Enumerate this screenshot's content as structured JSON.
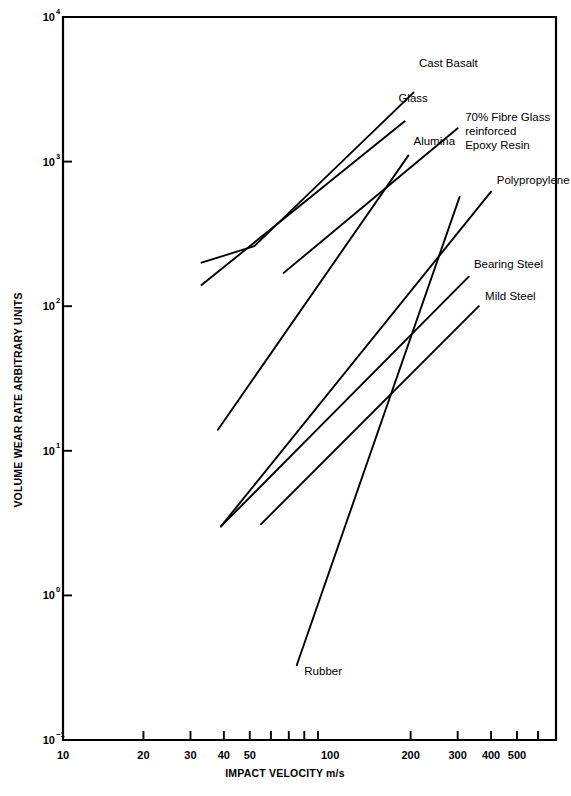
{
  "chart_data": {
    "type": "line",
    "title": "",
    "xlabel": "IMPACT VELOCITY m/s",
    "ylabel": "VOLUME WEAR RATE ARBITRARY UNITS",
    "xscale": "log",
    "yscale": "log",
    "xlim": [
      10,
      700
    ],
    "ylim": [
      0.1,
      10000
    ],
    "grid": false,
    "legend_position": "inline-right-of-line-ends",
    "xticks_major": [
      10,
      20,
      30,
      40,
      50,
      100,
      200,
      300,
      400,
      500
    ],
    "xtick_labels": [
      "10",
      "20",
      "30",
      "40",
      "50",
      "100",
      "200",
      "300",
      "400",
      "500"
    ],
    "yticks_major": [
      0.1,
      1,
      10,
      100,
      1000,
      10000
    ],
    "ytick_labels": [
      "10−1",
      "10⁰",
      "10¹",
      "10²",
      "10³",
      "10⁴"
    ],
    "ytick_mantissas": [
      "10",
      "10",
      "10",
      "10",
      "10",
      "10"
    ],
    "ytick_exponents": [
      "-1",
      "0",
      "1",
      "2",
      "3",
      "4"
    ],
    "series": [
      {
        "name": "Cast Basalt",
        "label": "Cast Basalt",
        "points": [
          [
            33,
            200
          ],
          [
            52,
            260
          ],
          [
            205,
            3000
          ]
        ],
        "label_anchor": [
          215,
          4500
        ]
      },
      {
        "name": "Glass",
        "label": "Glass",
        "points": [
          [
            33,
            140
          ],
          [
            190,
            1900
          ]
        ],
        "label_anchor": [
          180,
          2600
        ]
      },
      {
        "name": "70% Fibre Glass reinforced Epoxy Resin",
        "label_line1": "70% Fibre Glass",
        "label_line2": "reinforced",
        "label_line3": "Epoxy Resin",
        "points": [
          [
            67,
            170
          ],
          [
            300,
            1700
          ]
        ],
        "label_anchor": [
          320,
          1900
        ]
      },
      {
        "name": "Alumina",
        "label": "Alumina",
        "points": [
          [
            38,
            14
          ],
          [
            196,
            1100
          ]
        ],
        "label_anchor": [
          205,
          1300
        ]
      },
      {
        "name": "Polypropylene",
        "label": "Polypropylene",
        "points": [
          [
            39,
            3
          ],
          [
            400,
            620
          ]
        ],
        "label_anchor": [
          420,
          700
        ]
      },
      {
        "name": "Bearing Steel",
        "label": "Bearing Steel",
        "points": [
          [
            39,
            3
          ],
          [
            330,
            160
          ]
        ],
        "label_anchor": [
          345,
          185
        ]
      },
      {
        "name": "Mild Steel",
        "label": "Mild Steel",
        "points": [
          [
            55,
            3.1
          ],
          [
            360,
            100
          ]
        ],
        "label_anchor": [
          380,
          110
        ]
      },
      {
        "name": "Rubber",
        "label": "Rubber",
        "points": [
          [
            75,
            0.33
          ],
          [
            305,
            570
          ]
        ],
        "label_anchor": [
          80,
          0.28
        ]
      }
    ]
  }
}
